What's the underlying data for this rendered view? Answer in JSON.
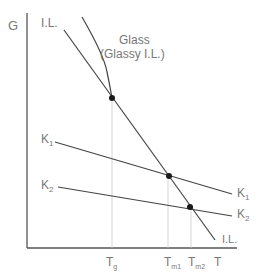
{
  "diagram": {
    "axes": {
      "y_label": "G",
      "x_label": "T"
    },
    "curves": {
      "il_top_label": "I.L.",
      "il_bottom_label": "I.L.",
      "glass_label_line1": "Glass",
      "glass_label_line2": "(Glassy I.L.)",
      "k1_left_label": "K",
      "k1_left_sub": "1",
      "k1_right_label": "K",
      "k1_right_sub": "1",
      "k2_left_label": "K",
      "k2_left_sub": "2",
      "k2_right_label": "K",
      "k2_right_sub": "2"
    },
    "x_ticks": {
      "tg_main": "T",
      "tg_sub": "g",
      "tm1_main": "T",
      "tm1_sub": "m1",
      "tm2_main": "T",
      "tm2_sub": "m2"
    },
    "colors": {
      "line": "#444444",
      "text": "#777777",
      "guide": "#cccccc",
      "point": "#1a1a1a"
    }
  }
}
